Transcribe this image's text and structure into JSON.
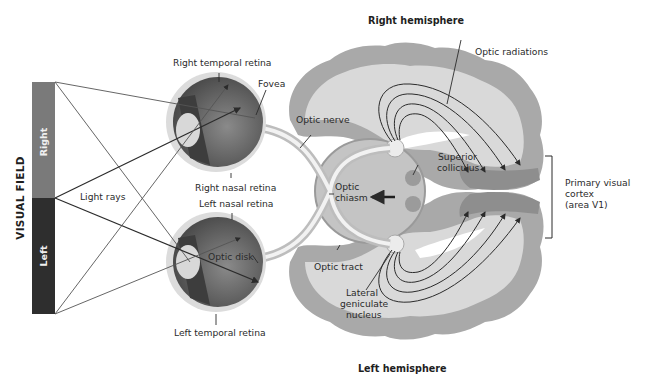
{
  "title": {
    "right_hemisphere": "Right hemisphere",
    "left_hemisphere": "Left hemisphere"
  },
  "visual_field": {
    "label": "VISUAL FIELD",
    "right": "Right",
    "left": "Left",
    "colors": {
      "right": "#7a7a7a",
      "left": "#2e2e2e"
    }
  },
  "labels": {
    "light_rays": "Light rays",
    "right_temporal_retina": "Right temporal retina",
    "fovea": "Fovea",
    "right_nasal_retina": "Right nasal retina",
    "left_nasal_retina": "Left nasal retina",
    "optic_disk": "Optic disk",
    "left_temporal_retina": "Left temporal retina",
    "optic_nerve": "Optic nerve",
    "optic_chiasm_1": "Optic",
    "optic_chiasm_2": "chiasm",
    "superior_colliculus_1": "Superior",
    "superior_colliculus_2": "colliculus",
    "optic_tract": "Optic tract",
    "lgn_1": "Lateral",
    "lgn_2": "geniculate",
    "lgn_3": "nucleus",
    "optic_radiations": "Optic radiations",
    "v1_1": "Primary visual",
    "v1_2": "cortex",
    "v1_3": "(area V1)"
  },
  "colors": {
    "cortex_gray": "#a9a9a9",
    "white_matter": "#d9d9d9",
    "eye_dark": "#555555",
    "eye_light": "#cfcfcf",
    "line": "#3a3a3a"
  }
}
